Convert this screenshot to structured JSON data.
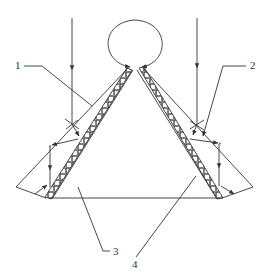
{
  "figure": {
    "labels": [
      {
        "id": "1",
        "text": "1"
      },
      {
        "id": "2",
        "text": "2"
      },
      {
        "id": "3",
        "text": "3"
      },
      {
        "id": "4",
        "text": "4"
      }
    ],
    "colors": {
      "line": "#333333",
      "background": "#ffffff"
    }
  }
}
